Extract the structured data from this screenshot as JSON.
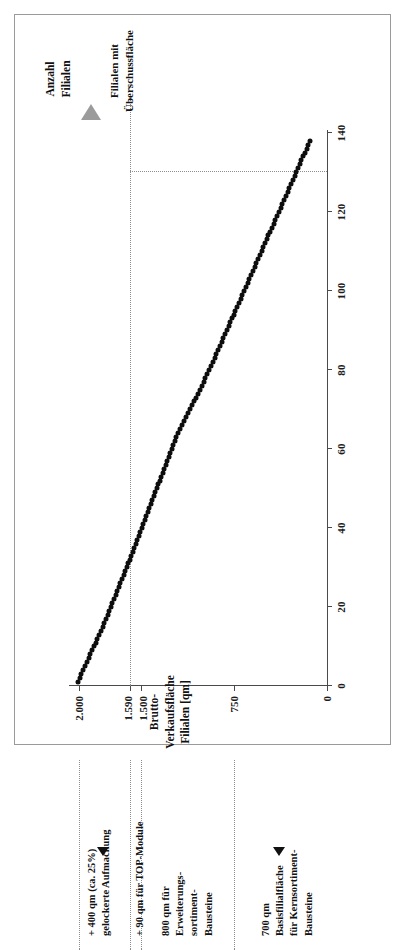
{
  "figure": {
    "frame": true
  },
  "chart_data": {
    "type": "scatter",
    "title": "",
    "xlabel": "Anzahl Filialen",
    "ylabel": "Brutto-Verkaufsfläche Filialen [qm]",
    "xlim": [
      0,
      145
    ],
    "ylim": [
      0,
      2100
    ],
    "grid": false,
    "legend": null,
    "x_ticks": [
      0,
      20,
      40,
      60,
      80,
      100,
      120,
      140
    ],
    "x_tick_labels": [
      "0",
      "20",
      "40",
      "60",
      "80",
      "100",
      "120",
      "140"
    ],
    "y_ticks": [
      0,
      750,
      1500,
      1590,
      2000
    ],
    "y_tick_labels": [
      "0",
      "750",
      "1.500",
      "1.590",
      "2.000"
    ],
    "series": [
      {
        "name": "Brutto-Verkaufsfläche je Filiale (absteigend sortiert)",
        "marker": "filled-circle",
        "color": "#0d0d0d",
        "x": [
          1,
          2,
          3,
          4,
          5,
          6,
          7,
          8,
          9,
          10,
          11,
          12,
          13,
          14,
          15,
          16,
          17,
          18,
          19,
          20,
          21,
          22,
          23,
          24,
          25,
          26,
          27,
          28,
          29,
          30,
          31,
          32,
          33,
          34,
          35,
          36,
          37,
          38,
          39,
          40,
          41,
          42,
          43,
          44,
          45,
          46,
          47,
          48,
          49,
          50,
          51,
          52,
          53,
          54,
          55,
          56,
          57,
          58,
          59,
          60,
          61,
          62,
          63,
          64,
          65,
          66,
          67,
          68,
          69,
          70,
          71,
          72,
          73,
          74,
          75,
          76,
          77,
          78,
          79,
          80,
          81,
          82,
          83,
          84,
          85,
          86,
          87,
          88,
          89,
          90,
          91,
          92,
          93,
          94,
          95,
          96,
          97,
          98,
          99,
          100,
          101,
          102,
          103,
          104,
          105,
          106,
          107,
          108,
          109,
          110,
          111,
          112,
          113,
          114,
          115,
          116,
          117,
          118,
          119,
          120,
          121,
          122,
          123,
          124,
          125,
          126,
          127,
          128,
          129,
          130,
          131,
          132,
          133,
          134,
          135,
          136,
          137,
          138
        ],
        "y": [
          2010,
          1995,
          1980,
          1965,
          1950,
          1936,
          1922,
          1908,
          1894,
          1880,
          1866,
          1852,
          1838,
          1824,
          1810,
          1796,
          1783,
          1770,
          1757,
          1744,
          1731,
          1718,
          1705,
          1692,
          1679,
          1666,
          1653,
          1640,
          1627,
          1614,
          1601,
          1589,
          1577,
          1565,
          1553,
          1541,
          1529,
          1517,
          1505,
          1493,
          1481,
          1469,
          1457,
          1445,
          1433,
          1421,
          1409,
          1397,
          1385,
          1373,
          1361,
          1349,
          1337,
          1325,
          1313,
          1301,
          1289,
          1277,
          1265,
          1253,
          1241,
          1229,
          1217,
          1202,
          1186,
          1170,
          1154,
          1138,
          1122,
          1106,
          1090,
          1074,
          1058,
          1042,
          1026,
          1010,
          995,
          980,
          965,
          950,
          935,
          920,
          906,
          892,
          878,
          864,
          850,
          836,
          822,
          808,
          794,
          780,
          766,
          752,
          738,
          724,
          710,
          696,
          682,
          668,
          654,
          640,
          626,
          612,
          598,
          584,
          570,
          556,
          542,
          528,
          514,
          500,
          486,
          472,
          458,
          444,
          430,
          416,
          402,
          388,
          374,
          360,
          346,
          332,
          318,
          304,
          290,
          276,
          262,
          248,
          234,
          220,
          206,
          192,
          178,
          164,
          150,
          136
        ]
      }
    ],
    "reference_lines": [
      {
        "name": "threshold-horizontal",
        "orientation": "horizontal",
        "y": 1590,
        "from_x": 0,
        "to_x": 130,
        "style": "dotted"
      },
      {
        "name": "threshold-vertical",
        "orientation": "vertical",
        "x": 130,
        "from_y": 0,
        "to_y": 1590,
        "style": "dotted"
      }
    ]
  },
  "axis_titles": {
    "y": "Brutto-Verkaufsfläche\nFilialen [qm]",
    "x": "Anzahl\nFilialen"
  },
  "y_tick_labels": {
    "t2000": "2.000",
    "t1590": "1.590",
    "t1500": "1.500",
    "t750": "750",
    "t0": "0"
  },
  "x_tick_labels": {
    "t0": "0",
    "t20": "20",
    "t40": "40",
    "t60": "60",
    "t80": "80",
    "t100": "100",
    "t120": "120",
    "t140": "140"
  },
  "annotations": {
    "surplus": "Filialen mit\nÜberschussfläche",
    "band_top": "+ 400 qm (ca. 25%)\ngelockerte Aufmachung",
    "band_top_module": "+ 90 qm für TOP-Module",
    "band_mid": "800 qm für\nErweiterungs-\nsortiment-\nBausteine",
    "band_low": "700 qm\nBasisfilialfläche\nfür Kernsortiment-\nBausteine"
  },
  "colors": {
    "marker": "#0d0d0d",
    "axis": "#4a4a4a",
    "guide": "#8d8d8d",
    "arrow_grey": "#9b9b9b",
    "frame": "#9a9a9a",
    "text": "#111111"
  }
}
